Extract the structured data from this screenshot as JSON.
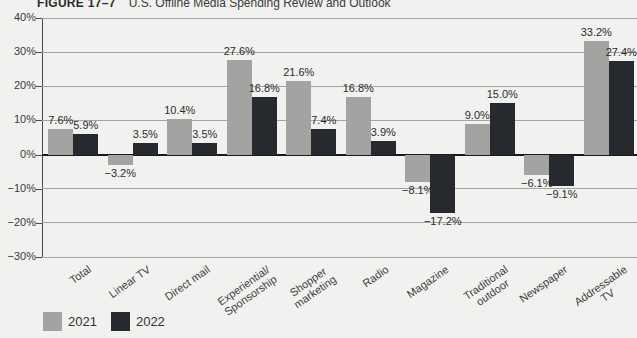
{
  "figure": {
    "label": "FIGURE 17–7",
    "caption": "U.S. Offline Media Spending Review and Outlook"
  },
  "chart_data": {
    "type": "bar",
    "title": "U.S. Offline Media Spending Review and Outlook",
    "title_prefix": "FIGURE 17–7",
    "categories": [
      "Total",
      "Linear TV",
      "Direct mail",
      "Experiential/\nSponsorship",
      "Shopper\nmarketing",
      "Radio",
      "Magazine",
      "Traditional\noutdoor",
      "Newspaper",
      "Addressable\nTV"
    ],
    "series": [
      {
        "name": "2021",
        "color": "#a3a3a1",
        "values": [
          7.6,
          -3.2,
          10.4,
          27.6,
          21.6,
          16.8,
          -8.1,
          9.0,
          -6.1,
          33.2
        ],
        "labels": [
          "7.6%",
          "−3.2%",
          "10.4%",
          "27.6%",
          "21.6%",
          "16.8%",
          "−8.1%",
          "9.0%",
          "−6.1%",
          "33.2%"
        ]
      },
      {
        "name": "2022",
        "color": "#26292e",
        "values": [
          5.9,
          3.5,
          3.5,
          16.8,
          7.4,
          3.9,
          -17.2,
          15.0,
          -9.1,
          27.4
        ],
        "labels": [
          "5.9%",
          "3.5%",
          "3.5%",
          "16.8%",
          "7.4%",
          "3.9%",
          "−17.2%",
          "15.0%",
          "−9.1%",
          "27.4%"
        ]
      }
    ],
    "ylim": [
      -30,
      40
    ],
    "ytick_step": 10,
    "yticks": [
      "40%",
      "30%",
      "20%",
      "10%",
      "0%",
      "−10%",
      "−20%",
      "−30%"
    ],
    "grid": true,
    "legend_position": "bottom-left"
  }
}
